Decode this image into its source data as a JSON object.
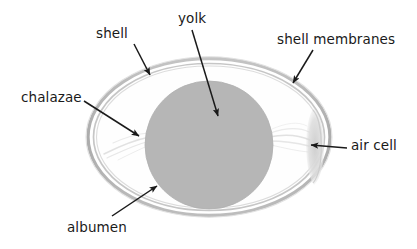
{
  "diagram": {
    "background_color": "#ffffff",
    "text_color": "#1a1a1a",
    "labels": [
      {
        "id": "shell",
        "text": "shell",
        "x": 96,
        "y": 27,
        "arrow_from": [
          134,
          44
        ],
        "arrow_to": [
          150,
          75
        ]
      },
      {
        "id": "yolk",
        "text": "yolk",
        "x": 178,
        "y": 12,
        "arrow_from": [
          192,
          30
        ],
        "arrow_to": [
          218,
          116
        ]
      },
      {
        "id": "shell_membranes",
        "text": "shell membranes",
        "x": 277,
        "y": 33,
        "arrow_from": [
          313,
          50
        ],
        "arrow_to": [
          293,
          83
        ]
      },
      {
        "id": "chalazae",
        "text": "chalazae",
        "x": 21,
        "y": 91,
        "arrow_from": [
          84,
          101
        ],
        "arrow_to": [
          139,
          136
        ]
      },
      {
        "id": "air_cell",
        "text": "air cell",
        "x": 351,
        "y": 139,
        "arrow_from": [
          347,
          148
        ],
        "arrow_to": [
          311,
          145
        ]
      },
      {
        "id": "albumen",
        "text": "albumen",
        "x": 67,
        "y": 221,
        "arrow_from": [
          112,
          216
        ],
        "arrow_to": [
          157,
          186
        ]
      }
    ],
    "parts": {
      "shell": {
        "name": "shell",
        "shape": "ellipse-outline",
        "center": [
          209,
          137
        ],
        "radius_x": 122,
        "radius_y": 79,
        "stroke_color": "#b3b3b3",
        "stroke_width": 3.2
      },
      "shell_membranes": {
        "name": "shell membranes",
        "shape": "ellipse-outline-inner",
        "center": [
          209,
          137
        ],
        "radius_x": 116,
        "radius_y": 74,
        "stroke_color": "#c2c2c2",
        "stroke_width": 1.8
      },
      "albumen": {
        "name": "albumen",
        "shape": "ellipse-fill",
        "fill_color": "#fefefe"
      },
      "yolk": {
        "name": "yolk",
        "shape": "circle",
        "center": [
          209,
          145
        ],
        "radius": 64,
        "fill_color": "#b6b6b6"
      },
      "air_cell": {
        "name": "air cell",
        "shape": "lens",
        "center": [
          313,
          146
        ],
        "fill_color": "#d8d8d8"
      },
      "chalazae": {
        "name": "chalazae",
        "shape": "wispy-strands",
        "stroke_color": "#d9d9d9"
      }
    },
    "arrow_color": "#1a1a1a",
    "arrow_width": 1.5
  }
}
